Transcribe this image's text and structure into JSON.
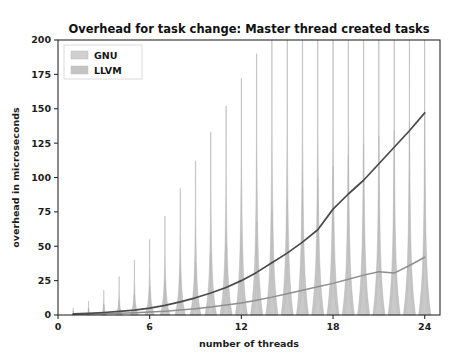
{
  "chart_data": {
    "type": "area",
    "title": "Overhead for task change: Master thread created tasks",
    "xlabel": "number of threads",
    "ylabel": "overhead in microseconds",
    "xlim": [
      0,
      25
    ],
    "ylim": [
      0,
      200
    ],
    "xticks": [
      0,
      6,
      12,
      18,
      24
    ],
    "xticklabels": [
      "0",
      "6",
      "12",
      "18",
      "24"
    ],
    "yticks": [
      0,
      25,
      50,
      75,
      100,
      125,
      150,
      175,
      200
    ],
    "yticklabels": [
      "0",
      "25",
      "50",
      "75",
      "100",
      "125",
      "150",
      "175",
      "200"
    ],
    "grid": false,
    "legend_position": "upper left",
    "legend": [
      "GNU",
      "LLVM"
    ],
    "x": [
      1,
      2,
      3,
      4,
      5,
      6,
      7,
      8,
      9,
      10,
      11,
      12,
      13,
      14,
      15,
      16,
      17,
      18,
      19,
      20,
      21,
      22,
      23,
      24
    ],
    "series": [
      {
        "name": "GNU",
        "color": "#4a4a4a",
        "violin_color": "#b9b9b9",
        "median": [
          0.8,
          1.2,
          1.8,
          2.6,
          3.6,
          5.0,
          7.0,
          9.5,
          12.5,
          16.0,
          20.0,
          25.0,
          31.0,
          38.0,
          45.0,
          53.0,
          62.0,
          77.0,
          88.0,
          98.0,
          110.0,
          122.0,
          134.0,
          147.0
        ],
        "violin_top": [
          5,
          10,
          18,
          28,
          40,
          55,
          72,
          92,
          112,
          133,
          152,
          172,
          190,
          200,
          200,
          200,
          200,
          200,
          200,
          200,
          200,
          200,
          200,
          200
        ],
        "violin_max_width": [
          0.1,
          0.14,
          0.18,
          0.22,
          0.26,
          0.3,
          0.32,
          0.34,
          0.36,
          0.38,
          0.4,
          0.4,
          0.4,
          0.4,
          0.4,
          0.4,
          0.4,
          0.4,
          0.4,
          0.4,
          0.4,
          0.4,
          0.4,
          0.4
        ]
      },
      {
        "name": "LLVM",
        "color": "#8e8e8e",
        "violin_color": "#c9c9c9",
        "median": [
          0.5,
          0.7,
          1.0,
          1.3,
          1.7,
          2.2,
          2.8,
          3.6,
          4.6,
          5.8,
          7.2,
          8.8,
          10.8,
          13.0,
          15.5,
          18.0,
          20.5,
          23.0,
          26.0,
          29.0,
          31.5,
          30.5,
          36.0,
          42.0
        ],
        "violin_top": [
          3,
          5,
          8,
          11,
          15,
          20,
          25,
          31,
          38,
          45,
          52,
          60,
          68,
          76,
          84,
          92,
          100,
          108,
          116,
          124,
          130,
          134,
          140,
          148
        ],
        "violin_max_width": [
          0.08,
          0.1,
          0.12,
          0.14,
          0.16,
          0.18,
          0.2,
          0.22,
          0.24,
          0.25,
          0.26,
          0.27,
          0.28,
          0.28,
          0.28,
          0.28,
          0.28,
          0.28,
          0.28,
          0.28,
          0.28,
          0.28,
          0.28,
          0.28
        ]
      }
    ]
  }
}
